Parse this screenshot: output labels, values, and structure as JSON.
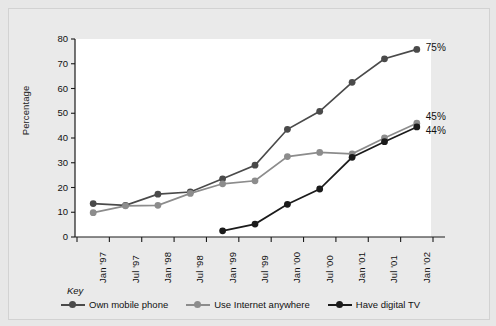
{
  "chart_data": {
    "type": "line",
    "title": "",
    "xlabel": "",
    "ylabel": "Percentage",
    "ylim": [
      0,
      80
    ],
    "yticks": [
      0,
      10,
      20,
      30,
      40,
      50,
      60,
      70,
      80
    ],
    "grid": false,
    "legend_position": "bottom",
    "legend_title": "Key",
    "categories": [
      "Jan '97",
      "Jul '97",
      "Jan '98",
      "Jul '98",
      "Jan '99",
      "Jul '99",
      "Jan '00",
      "Jul '00",
      "Jan '01",
      "Jul '01",
      "Jan '02"
    ],
    "series": [
      {
        "name": "Own mobile phone",
        "color": "#4a4a4a",
        "values": [
          13.5,
          12.8,
          17.3,
          18.2,
          23.5,
          29.0,
          43.5,
          50.8,
          62.5,
          72.0,
          75.8
        ],
        "end_label": "75%"
      },
      {
        "name": "Use Internet anywhere",
        "color": "#8c8c8c",
        "values": [
          9.8,
          12.6,
          12.8,
          17.6,
          21.5,
          22.7,
          32.5,
          34.2,
          33.6,
          40.0,
          46.0
        ],
        "end_label": "45%"
      },
      {
        "name": "Have digital TV",
        "color": "#1b1b1b",
        "values": [
          null,
          null,
          null,
          null,
          2.5,
          5.2,
          13.2,
          19.4,
          32.2,
          38.5,
          44.5
        ],
        "end_label": "44%"
      }
    ],
    "annotations": [
      {
        "text": "75%",
        "series": "Own mobile phone"
      },
      {
        "text": "45%",
        "series": "Use Internet anywhere"
      },
      {
        "text": "44%",
        "series": "Have digital TV"
      }
    ]
  },
  "colors": {
    "background": "#e7e7e7",
    "plot_background": "#ffffff",
    "axis": "#1a1a1a",
    "series_1": "#4a4a4a",
    "series_2": "#8c8c8c",
    "series_3": "#1b1b1b"
  }
}
